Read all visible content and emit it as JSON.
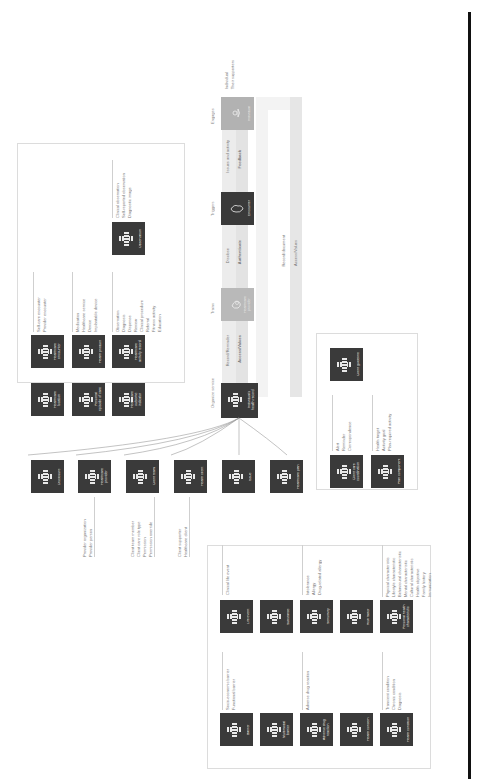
{
  "stages": [
    "Organize service",
    "Trains",
    "Triggers",
    "Engages"
  ],
  "flow": {
    "top_row": [
      "Record/Reminder",
      "Disclose",
      "Issues and activity"
    ],
    "bottom_row": [
      "Access/Values",
      "Authenticate",
      "Feedback"
    ],
    "return_labels": [
      "Record/document",
      "Access/Values"
    ]
  },
  "actors": {
    "hub": {
      "label": "Individual's health record"
    },
    "trains": {
      "label": "Healthcare provider"
    },
    "triggers": {
      "label": "Encounter"
    },
    "engages": {
      "label": "Individual",
      "notes": [
        "Individual",
        "Their supporters"
      ]
    }
  },
  "top_panel": {
    "row1": [
      {
        "label": "Healthcare location"
      },
      {
        "label": "Healthcare encounter",
        "items": [
          "Self-care encounter",
          "Provider encounter"
        ]
      }
    ],
    "row2": [
      {
        "label": "Personal episode of care"
      },
      {
        "label": "Health product",
        "items": [
          "Medication",
          "Healthcare service",
          "Device",
          "Implantable device"
        ]
      }
    ],
    "row3": [
      {
        "label": "Healthcare outcome indicator"
      },
      {
        "label": "Healthcare activity record",
        "items": [
          "Observation",
          "Diagnosis",
          "Dispense",
          "Review",
          "Clinical procedure",
          "Referral",
          "Fitness activity",
          "Education"
        ]
      },
      {
        "label": "Observation",
        "items": [
          "Clinical observation",
          "Self-reported observation",
          "Diagnostic image"
        ]
      }
    ]
  },
  "mid_nodes": [
    {
      "label": "Disclosure"
    },
    {
      "label": "Healthcare provider",
      "items": [
        "Provider organization",
        "Provider person"
      ]
    },
    {
      "label": "Client team",
      "items": [
        "Client team member",
        "Client care role type",
        "Permission",
        "Permission override"
      ]
    },
    {
      "label": "Health client",
      "items": [
        "Client supporter",
        "Healthcare client"
      ]
    },
    {
      "label": "Issue"
    },
    {
      "label": "Healthcare plan"
    }
  ],
  "right_panel": {
    "items": [
      {
        "label": "Client care coordination",
        "items": [
          "Alert",
          "Reminder",
          "Correspondence"
        ]
      },
      {
        "label": "Plan component",
        "items": [
          "Health target",
          "Activity goal",
          "Plan-required activity"
        ]
      },
      {
        "label": "Client guideline"
      }
    ]
  },
  "bottom_panel": {
    "col_a": [
      {
        "label": "Barrier",
        "items": [
          "Socio-economic barrier",
          "Functional barrier"
        ]
      },
      {
        "label": "Life event",
        "items": [
          "Clinical life event"
        ]
      }
    ],
    "col_b": [
      {
        "label": "Multimodal barrier"
      },
      {
        "label": "Substance"
      }
    ],
    "col_c": [
      {
        "label": "Adverse drug reaction",
        "items": [
          "Adverse drug reaction"
        ]
      },
      {
        "label": "Sensitivity",
        "items": [
          "Intolerance",
          "Allergy",
          "Drug-related allergy"
        ]
      }
    ],
    "col_d": [
      {
        "label": "Health concern"
      },
      {
        "label": "Risk factor"
      }
    ],
    "col_e": [
      {
        "label": "Health condition",
        "items": [
          "Transient condition",
          "Chronic condition",
          "Diagnosis"
        ]
      },
      {
        "label": "Personal health characteristic",
        "items": [
          "Physical characteristic",
          "Lifestyle characteristic",
          "Behavioural characteristic",
          "Mental characteristic",
          "Cultural characteristic",
          "Health objective",
          "Family history",
          "Immunization"
        ]
      }
    ]
  }
}
